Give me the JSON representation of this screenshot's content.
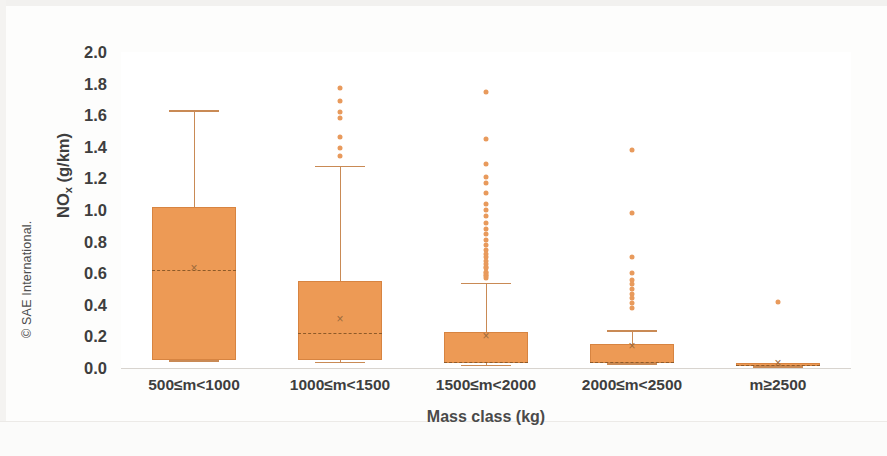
{
  "credit": "© SAE International.",
  "chart_data": {
    "type": "box",
    "title": "",
    "xlabel": "Mass class (kg)",
    "ylabel": "NOx (g/km)",
    "ylabel_base": "NO",
    "ylabel_sub": "x",
    "ylabel_unit": " (g/km)",
    "ylim": [
      0.0,
      2.0
    ],
    "ytick_labels": [
      "2.0",
      "1.8",
      "1.6",
      "1.4",
      "1.2",
      "1.0",
      "0.8",
      "0.6",
      "0.4",
      "0.2",
      "0.0"
    ],
    "ytick_values": [
      2.0,
      1.8,
      1.6,
      1.4,
      1.2,
      1.0,
      0.8,
      0.6,
      0.4,
      0.2,
      0.0
    ],
    "grid": false,
    "legend": "none",
    "categories": [
      "500≤m<1000",
      "1000≤m<1500",
      "1500≤m<2000",
      "2000≤m<2500",
      "m≥2500"
    ],
    "box_color": "#ED9A55",
    "outlier_color": "#E89A5C",
    "whisker_color": "#C98A55",
    "boxes": [
      {
        "category": "500≤m<1000",
        "whisker_low": 0.05,
        "q1": 0.05,
        "median": 0.62,
        "mean": 0.63,
        "q3": 1.02,
        "whisker_high": 1.63,
        "outliers": []
      },
      {
        "category": "1000≤m<1500",
        "whisker_low": 0.04,
        "q1": 0.05,
        "median": 0.22,
        "mean": 0.31,
        "q3": 0.55,
        "whisker_high": 1.28,
        "outliers": [
          1.77,
          1.69,
          1.62,
          1.58,
          1.46,
          1.39,
          1.34
        ]
      },
      {
        "category": "1500≤m<2000",
        "whisker_low": 0.02,
        "q1": 0.03,
        "median": 0.04,
        "mean": 0.2,
        "q3": 0.23,
        "whisker_high": 0.54,
        "outliers": [
          1.75,
          1.45,
          1.29,
          1.21,
          1.17,
          1.11,
          1.04,
          1.0,
          0.96,
          0.92,
          0.88,
          0.85,
          0.81,
          0.78,
          0.75,
          0.72,
          0.7,
          0.68,
          0.66,
          0.64,
          0.63,
          0.61,
          0.6,
          0.59,
          0.58,
          0.57
        ]
      },
      {
        "category": "2000≤m<2500",
        "whisker_low": 0.03,
        "q1": 0.03,
        "median": 0.04,
        "mean": 0.14,
        "q3": 0.15,
        "whisker_high": 0.24,
        "outliers": [
          1.38,
          0.98,
          0.7,
          0.6,
          0.56,
          0.53,
          0.5,
          0.47,
          0.44,
          0.41,
          0.38
        ]
      },
      {
        "category": "m≥2500",
        "whisker_low": 0.01,
        "q1": 0.01,
        "median": 0.02,
        "mean": 0.03,
        "q3": 0.03,
        "whisker_high": 0.03,
        "outliers": [
          0.42
        ]
      }
    ]
  }
}
